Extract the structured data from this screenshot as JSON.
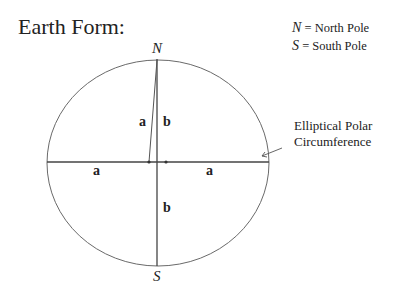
{
  "title": "Earth Form:",
  "legend": [
    {
      "symbol": "N",
      "text": "= North Pole"
    },
    {
      "symbol": "S",
      "text": "= South Pole"
    }
  ],
  "poles": {
    "north": "N",
    "south": "S"
  },
  "labels": {
    "a_slanted": "a",
    "b_upper": "b",
    "a_left": "a",
    "a_right": "a",
    "b_lower": "b"
  },
  "annotation": {
    "line1": "Elliptical Polar",
    "line2": "Circumference"
  },
  "colors": {
    "stroke": "#555555",
    "text": "#222222"
  }
}
